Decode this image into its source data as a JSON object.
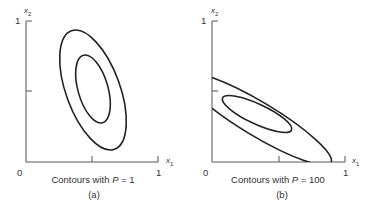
{
  "panels": [
    {
      "id": "a",
      "caption_prefix": "Contours with ",
      "param_name": "P",
      "param_eq": " = 1",
      "sub_label": "(a)",
      "origin_label": "0",
      "x_end_label": "1",
      "y_end_label": "1",
      "x_axis_label": "x",
      "x_axis_sub": "1",
      "y_axis_label": "x",
      "y_axis_sub": "2",
      "contours": [
        "outer ellipse, tilted, centered ~(0.5,0.5)",
        "inner ellipse, tilted"
      ]
    },
    {
      "id": "b",
      "caption_prefix": "Contours with ",
      "param_name": "P",
      "param_eq": " = 100",
      "sub_label": "(b)",
      "origin_label": "0",
      "x_end_label": "1",
      "y_end_label": "1",
      "x_axis_label": "x",
      "x_axis_sub": "1",
      "y_axis_label": "x",
      "y_axis_sub": "2",
      "contours": [
        "outer elongated ellipse, strongly tilted",
        "inner elongated ellipse"
      ]
    }
  ],
  "colors": {
    "stroke": "#222222",
    "axis": "#444444"
  }
}
